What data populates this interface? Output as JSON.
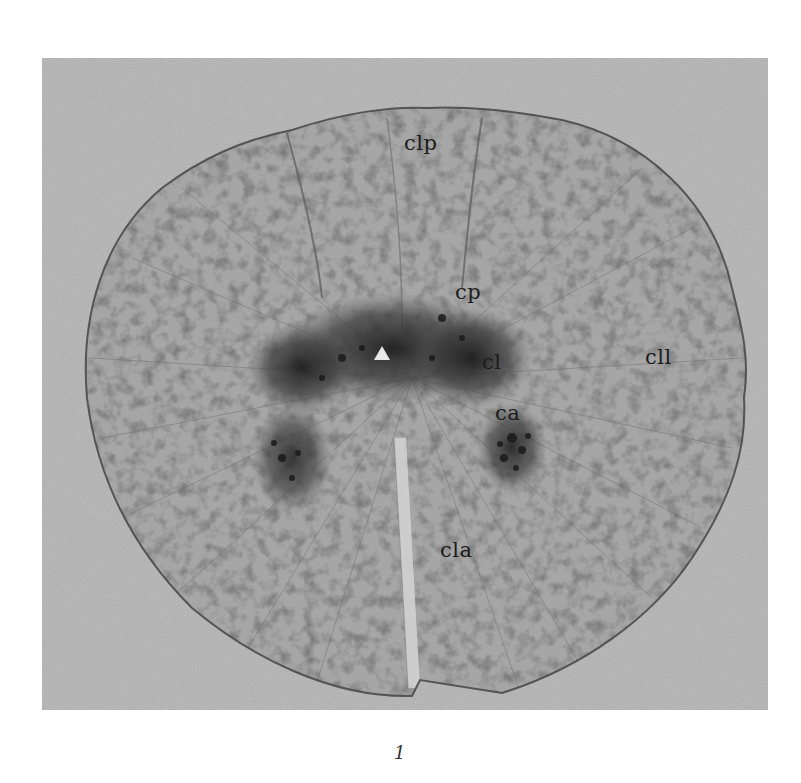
{
  "figure": {
    "number": "1",
    "background_color": "#b9b9b9",
    "section_color": "#a9a9a9",
    "grey_matter_color": "#3a3a3a"
  },
  "labels": [
    {
      "id": "clp",
      "text": "clp",
      "x": 404,
      "y": 133
    },
    {
      "id": "cp",
      "text": "cp",
      "x": 455,
      "y": 282
    },
    {
      "id": "cl",
      "text": "cl",
      "x": 482,
      "y": 352
    },
    {
      "id": "ca",
      "text": "ca",
      "x": 495,
      "y": 403
    },
    {
      "id": "cll",
      "text": "cll",
      "x": 645,
      "y": 347
    },
    {
      "id": "cla",
      "text": "cla",
      "x": 440,
      "y": 540
    }
  ]
}
